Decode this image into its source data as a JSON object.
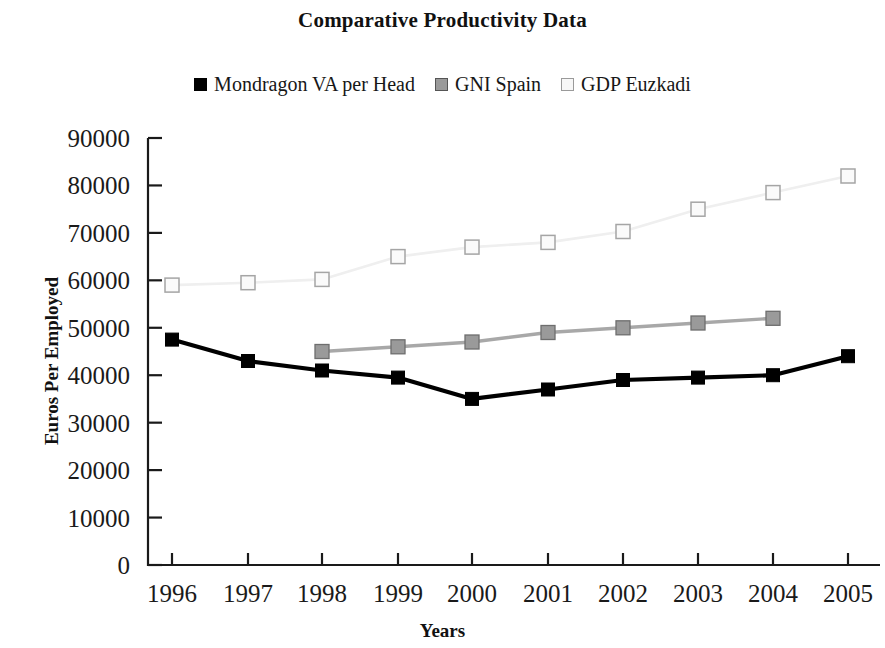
{
  "title": "Comparative Productivity Data",
  "legend": {
    "position": "top-center",
    "entries": [
      {
        "label": "Mondragon VA per Head",
        "swatch": "filled-square-black",
        "color": "#000000",
        "border": "#000000"
      },
      {
        "label": "GNI Spain",
        "swatch": "filled-square-gray",
        "color": "#9a9a9a",
        "border": "#555555"
      },
      {
        "label": "GDP Euzkadi",
        "swatch": "open-square-light",
        "color": "#f2f2f2",
        "border": "#9a9a9a"
      }
    ]
  },
  "axes": {
    "x_title": "Years",
    "y_title": "Euros Per Employed",
    "y_ticks": [
      "0",
      "10000",
      "20000",
      "30000",
      "40000",
      "50000",
      "60000",
      "70000",
      "80000",
      "90000"
    ],
    "x_ticks": [
      "1996",
      "1997",
      "1998",
      "1999",
      "2000",
      "2001",
      "2002",
      "2003",
      "2004",
      "2005"
    ]
  },
  "chart_data": {
    "type": "line",
    "title": "Comparative Productivity Data",
    "xlabel": "Years",
    "ylabel": "Euros Per Employed",
    "ylim": [
      0,
      90000
    ],
    "ytick_step": 10000,
    "grid": false,
    "legend_position": "top-center",
    "categories": [
      "1996",
      "1997",
      "1998",
      "1999",
      "2000",
      "2001",
      "2002",
      "2003",
      "2004",
      "2005"
    ],
    "series": [
      {
        "name": "Mondragon VA per Head",
        "color": "#000000",
        "marker": "filled-square",
        "values": [
          47500,
          43000,
          41000,
          39500,
          35000,
          37000,
          39000,
          39500,
          40000,
          44000
        ]
      },
      {
        "name": "GNI Spain",
        "color": "#9a9a9a",
        "marker": "filled-square",
        "values": [
          null,
          null,
          45000,
          46000,
          47000,
          49000,
          50000,
          51000,
          52000,
          null
        ]
      },
      {
        "name": "GDP Euzkadi",
        "color": "#e8e8e8",
        "marker": "open-square",
        "values": [
          59000,
          59500,
          60200,
          65000,
          67000,
          68000,
          70300,
          75000,
          78500,
          82000
        ]
      }
    ]
  },
  "geometry": {
    "plot_left": 148,
    "plot_right": 880,
    "plot_top": 138,
    "plot_bottom": 565,
    "x_positions": [
      172,
      248,
      322,
      398,
      472,
      548,
      623,
      698,
      773,
      848
    ]
  }
}
